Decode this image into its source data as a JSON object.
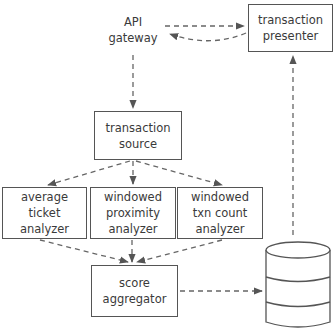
{
  "diagram": {
    "nodes": {
      "api_gateway": {
        "lines": [
          "API",
          "gateway"
        ]
      },
      "transaction_presenter": {
        "lines": [
          "transaction",
          "presenter"
        ]
      },
      "transaction_source": {
        "lines": [
          "transaction",
          "source"
        ]
      },
      "average_ticket_analyzer": {
        "lines": [
          "average",
          "ticket",
          "analyzer"
        ]
      },
      "windowed_proximity_analyzer": {
        "lines": [
          "windowed",
          "proximity",
          "analyzer"
        ]
      },
      "windowed_txn_count_analyzer": {
        "lines": [
          "windowed",
          "txn count",
          "analyzer"
        ]
      },
      "score_aggregator": {
        "lines": [
          "score",
          "aggregator"
        ]
      },
      "database": {
        "shape": "cylinder"
      }
    },
    "edges": [
      {
        "from": "api_gateway",
        "to": "transaction_presenter",
        "style": "dashed"
      },
      {
        "from": "transaction_presenter",
        "to": "api_gateway",
        "style": "dashed"
      },
      {
        "from": "api_gateway",
        "to": "transaction_source",
        "style": "dashed"
      },
      {
        "from": "transaction_source",
        "to": "average_ticket_analyzer",
        "style": "dashed"
      },
      {
        "from": "transaction_source",
        "to": "windowed_proximity_analyzer",
        "style": "dashed"
      },
      {
        "from": "transaction_source",
        "to": "windowed_txn_count_analyzer",
        "style": "dashed"
      },
      {
        "from": "average_ticket_analyzer",
        "to": "score_aggregator",
        "style": "dashed"
      },
      {
        "from": "windowed_proximity_analyzer",
        "to": "score_aggregator",
        "style": "dashed"
      },
      {
        "from": "windowed_txn_count_analyzer",
        "to": "score_aggregator",
        "style": "dashed"
      },
      {
        "from": "score_aggregator",
        "to": "database",
        "style": "dashed"
      },
      {
        "from": "database",
        "to": "transaction_presenter",
        "style": "dashed"
      }
    ],
    "colors": {
      "stroke": "#555555",
      "text": "#3a3a3a",
      "background": "#ffffff"
    }
  }
}
